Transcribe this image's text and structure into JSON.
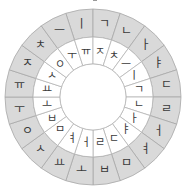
{
  "wheel": {
    "center": [
      93,
      97
    ],
    "outer_radius": 88,
    "mid_radius": 60,
    "hub_radius": 33,
    "colors": {
      "outer_fill": "#d9d9d9",
      "inner_fill": "#ffffff",
      "stroke": "#a8a8a8",
      "text": "#3a3a3a"
    },
    "outer_ring": {
      "start_angle_deg": -9,
      "items": [
        "ㅣ",
        "ㄱ",
        "ㄴ",
        "ㅏ",
        "ㅑ",
        "ㄷ",
        "ㄹ",
        "ㅓ",
        "ㅕ",
        "ㅁ",
        "ㅂ",
        "ㅗ",
        "ㅛ",
        "ㅅ",
        "ㅇ",
        "ㅜ",
        "ㅠ",
        "ㅈ",
        "ㅊ",
        "ㅡ"
      ]
    },
    "inner_ring": {
      "start_angle_deg": -27,
      "items": [
        "ㅜ",
        "ㅠ",
        "ㅈ",
        "ㅊ",
        "ㅡ",
        "ㅣ",
        "ㄱ",
        "ㄴ",
        "ㅏ",
        "ㅑ",
        "ㄷ",
        "ㄹ",
        "ㅓ",
        "ㅕ",
        "ㅁ",
        "ㅂ",
        "ㅗ",
        "ㅛ",
        "ㅅ",
        "ㅇ"
      ]
    },
    "hub_label": ""
  }
}
